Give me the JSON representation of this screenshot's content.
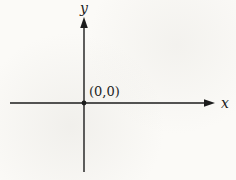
{
  "diagram": {
    "type": "cartesian-axes",
    "y_axis_label": "y",
    "x_axis_label": "x",
    "origin_label": "(0,0)",
    "origin_point": {
      "x": 0,
      "y": 0
    },
    "colors": {
      "axis": "#1c1c1c",
      "text": "#1c1c1c",
      "background": "#fbfaf7"
    }
  }
}
